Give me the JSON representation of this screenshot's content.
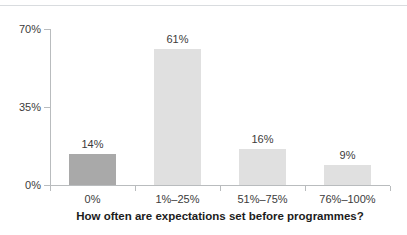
{
  "chart_data": {
    "type": "bar",
    "title": "",
    "xlabel": "How often are expectations set before programmes?",
    "ylabel": "",
    "categories": [
      "0%",
      "1%–25%",
      "51%–75%",
      "76%–100%"
    ],
    "values": [
      14,
      61,
      16,
      9
    ],
    "data_labels": [
      "14%",
      "61%",
      "16%",
      "9%"
    ],
    "ylim": [
      0,
      70
    ],
    "yticks": [
      0,
      35,
      70
    ],
    "ytick_labels": [
      "0%",
      "35%",
      "70%"
    ],
    "grid": false,
    "legend": false,
    "bar_colors": [
      "#a9a9a9",
      "#e0e0e0",
      "#e0e0e0",
      "#e0e0e0"
    ],
    "axis_color": "#b9bcbe",
    "text_color": "#3b3b3b",
    "title_color": "#1c1c1c",
    "background": "#ffffff"
  },
  "decor": {
    "top_rule_color": "#d9dcdf"
  }
}
